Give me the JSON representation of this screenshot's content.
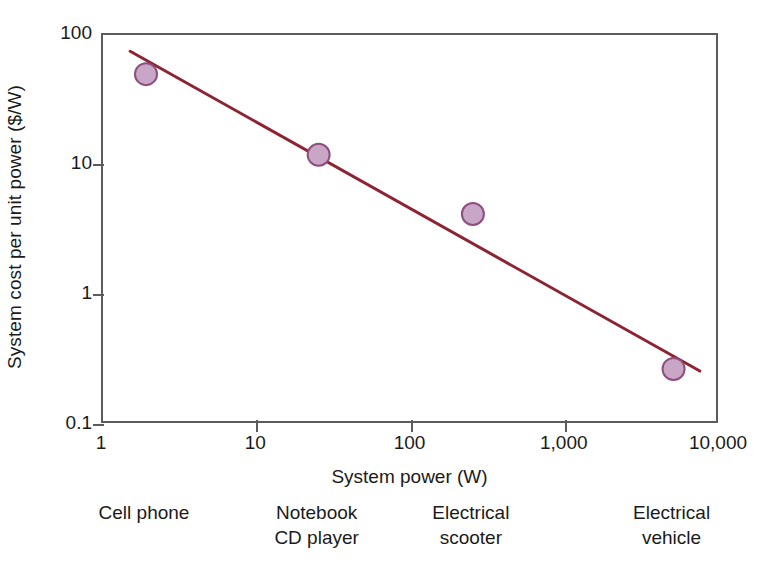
{
  "chart_data": {
    "type": "scatter",
    "title": "",
    "xlabel": "System power (W)",
    "ylabel": "System cost per unit power ($/W)",
    "xscale": "log",
    "yscale": "log",
    "xlim": [
      1,
      10000
    ],
    "ylim": [
      0.1,
      100
    ],
    "grid": false,
    "legend": false,
    "x_ticks": [
      {
        "value": 1,
        "label": "1"
      },
      {
        "value": 10,
        "label": "10"
      },
      {
        "value": 100,
        "label": "100"
      },
      {
        "value": 1000,
        "label": "1,000"
      },
      {
        "value": 10000,
        "label": "10,000"
      }
    ],
    "y_ticks": [
      {
        "value": 100,
        "label": "100"
      },
      {
        "value": 10,
        "label": "10"
      },
      {
        "value": 1,
        "label": "1"
      },
      {
        "value": 0.1,
        "label": "0.1"
      }
    ],
    "series": [
      {
        "name": "System cost per unit power",
        "type": "scatter",
        "marker_fill": "#c9a5c6",
        "marker_edge": "#8c4f80",
        "marker_radius": 11,
        "points": [
          {
            "x": 1.9,
            "y": 50,
            "category": "Cell phone"
          },
          {
            "x": 25,
            "y": 12,
            "category": "Notebook / CD player"
          },
          {
            "x": 250,
            "y": 4.2,
            "category": "Electrical scooter"
          },
          {
            "x": 5000,
            "y": 0.27,
            "category": "Electrical vehicle"
          }
        ]
      },
      {
        "name": "Trend line",
        "type": "line",
        "color": "#8c2433",
        "width": 3,
        "endpoints": [
          {
            "x": 1.5,
            "y": 75
          },
          {
            "x": 7400,
            "y": 0.26
          }
        ]
      }
    ],
    "category_annotations": [
      {
        "x": 1.9,
        "lines": [
          "Cell phone"
        ]
      },
      {
        "x": 25,
        "lines": [
          "Notebook",
          "CD player"
        ]
      },
      {
        "x": 250,
        "lines": [
          "Electrical",
          "scooter"
        ]
      },
      {
        "x": 5000,
        "lines": [
          "Electrical",
          "vehicle"
        ]
      }
    ]
  },
  "colors": {
    "axis": "#5b5b60",
    "text": "#1a1a1a",
    "trend": "#8c2433",
    "marker_fill": "#c9a5c6",
    "marker_edge": "#8c4f80",
    "background": "#ffffff"
  }
}
